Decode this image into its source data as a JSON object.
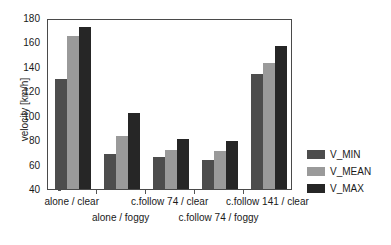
{
  "chart_data": {
    "type": "bar",
    "title": "",
    "xlabel": "",
    "ylabel": "velocity [km/h]",
    "ylim": [
      40,
      180
    ],
    "yticks": [
      40,
      60,
      80,
      100,
      120,
      140,
      160,
      180
    ],
    "grid": false,
    "legend_position": "right",
    "categories": [
      "alone / clear",
      "alone / foggy",
      "c.follow 74 / clear",
      "c.follow 74 / foggy",
      "c.follow 141 / clear"
    ],
    "series": [
      {
        "name": "V_MIN",
        "color": "#4d4d4d",
        "values": [
          130,
          69,
          66,
          64,
          134
        ]
      },
      {
        "name": "V_MEAN",
        "color": "#9a9a9a",
        "values": [
          165,
          83,
          72,
          71,
          143
        ]
      },
      {
        "name": "V_MAX",
        "color": "#262626",
        "values": [
          173,
          102,
          81,
          79,
          157
        ]
      }
    ]
  },
  "legend": {
    "items": [
      {
        "label": "V_MIN"
      },
      {
        "label": "V_MEAN"
      },
      {
        "label": "V_MAX"
      }
    ]
  }
}
